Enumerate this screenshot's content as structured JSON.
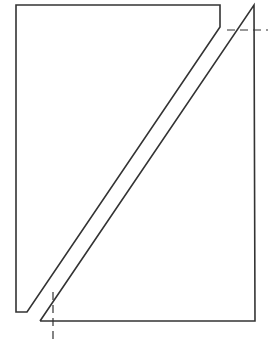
{
  "diagram": {
    "colors": {
      "stroke": "#333333",
      "background": "#ffffff",
      "dash": "#333333"
    },
    "left_piece": {
      "points": "16,5 220,5 220,27 212,30 27,312 18,312 16,312"
    },
    "right_piece": {
      "points": "254,5 255,321 40,321"
    },
    "dashed_lines": [
      {
        "name": "horizontal-reference",
        "x1": 227,
        "y1": 30,
        "x2": 268,
        "y2": 30
      },
      {
        "name": "vertical-reference",
        "x1": 53,
        "y1": 292,
        "x2": 53,
        "y2": 340
      }
    ]
  }
}
